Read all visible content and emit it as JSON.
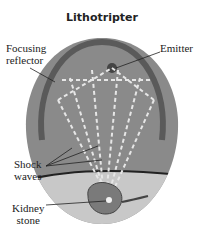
{
  "title": "Lithotripter",
  "labels": {
    "focusing_reflector": [
      "Focusing",
      "reflector"
    ],
    "emitter": "Emitter",
    "shock_waves": [
      "Shock",
      "waves"
    ],
    "kidney_stone": [
      "Kidney",
      "stone"
    ]
  },
  "colors": {
    "body": "#8a8a8a",
    "reflector": "#5a5a5a",
    "lower_tissue": "#c8c8c8",
    "wave_dash": "#e6e6e6",
    "kidney": "#7a7a7a"
  }
}
